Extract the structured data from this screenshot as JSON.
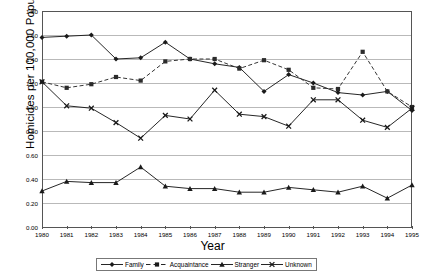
{
  "chart_data": {
    "type": "line",
    "title": "",
    "xlabel": "Year",
    "ylabel": "Homicides per 100,000 Population",
    "categories": [
      "1980",
      "1981",
      "1982",
      "1983",
      "1984",
      "1985",
      "1986",
      "1987",
      "1988",
      "1989",
      "1990",
      "1991",
      "1992",
      "1993",
      "1994",
      "1995"
    ],
    "x": [
      1980,
      1981,
      1982,
      1983,
      1984,
      1985,
      1986,
      1987,
      1988,
      1989,
      1990,
      1991,
      1992,
      1993,
      1994,
      1995
    ],
    "ylim": [
      0.0,
      1.8
    ],
    "yticks": [
      "0.00",
      "0.20",
      "0.40",
      "0.60",
      "0.80",
      "1.00",
      "1.20",
      "1.40",
      "1.60",
      "1.80"
    ],
    "ytick_values": [
      0.0,
      0.2,
      0.4,
      0.6,
      0.8,
      1.0,
      1.2,
      1.4,
      1.6,
      1.8
    ],
    "grid": true,
    "legend_position": "bottom",
    "series": [
      {
        "name": "Family",
        "marker": "diamond",
        "linestyle": "solid",
        "color": "#1a1a1a",
        "values": [
          1.58,
          1.59,
          1.6,
          1.4,
          1.41,
          1.54,
          1.4,
          1.36,
          1.33,
          1.13,
          1.27,
          1.2,
          1.12,
          1.1,
          1.13,
          0.97
        ]
      },
      {
        "name": "Acquaintance",
        "marker": "square",
        "linestyle": "dashed",
        "color": "#2b2b2b",
        "values": [
          1.21,
          1.16,
          1.19,
          1.25,
          1.22,
          1.38,
          1.4,
          1.4,
          1.32,
          1.39,
          1.31,
          1.16,
          1.15,
          1.46,
          1.13,
          1.0
        ]
      },
      {
        "name": "Stranger",
        "marker": "triangle",
        "linestyle": "solid",
        "color": "#1a1a1a",
        "values": [
          0.3,
          0.38,
          0.37,
          0.37,
          0.5,
          0.34,
          0.32,
          0.32,
          0.29,
          0.29,
          0.33,
          0.31,
          0.29,
          0.34,
          0.24,
          0.35
        ]
      },
      {
        "name": "Unknown",
        "marker": "x",
        "linestyle": "solid",
        "color": "#1a1a1a",
        "values": [
          1.21,
          1.01,
          0.99,
          0.87,
          0.74,
          0.93,
          0.9,
          1.14,
          0.94,
          0.92,
          0.84,
          1.06,
          1.06,
          0.89,
          0.83,
          0.99
        ]
      }
    ]
  },
  "axes": {
    "x_title": "Year",
    "y_title": "Homicides per 100,000 Population"
  },
  "legend": {
    "items": [
      {
        "label": "Family"
      },
      {
        "label": "Acquaintance"
      },
      {
        "label": "Stranger"
      },
      {
        "label": "Unknown"
      }
    ]
  },
  "caption": {
    "text": ""
  }
}
